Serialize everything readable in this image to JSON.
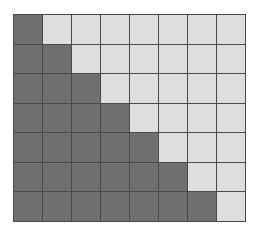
{
  "grid": {
    "rows": 7,
    "cols": 8,
    "colors": {
      "dark": "#6f6f6f",
      "light": "#dedede",
      "line": "#4a4a4a"
    },
    "cells": [
      [
        1,
        0,
        0,
        0,
        0,
        0,
        0,
        0
      ],
      [
        1,
        1,
        0,
        0,
        0,
        0,
        0,
        0
      ],
      [
        1,
        1,
        1,
        0,
        0,
        0,
        0,
        0
      ],
      [
        1,
        1,
        1,
        1,
        0,
        0,
        0,
        0
      ],
      [
        1,
        1,
        1,
        1,
        1,
        0,
        0,
        0
      ],
      [
        1,
        1,
        1,
        1,
        1,
        1,
        0,
        0
      ],
      [
        1,
        1,
        1,
        1,
        1,
        1,
        1,
        0
      ]
    ]
  }
}
